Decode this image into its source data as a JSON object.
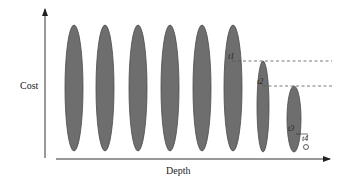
{
  "diagram": {
    "y_axis_label": "Cost",
    "x_axis_label": "Depth",
    "colors": {
      "ellipse_fill": "#6e6e6e",
      "ellipse_stroke": "#4a4a4a",
      "axis": "#333333",
      "dashed": "#555555"
    },
    "ellipses": [
      {
        "cx": 74,
        "top": 25,
        "bottom": 151,
        "rx": 9
      },
      {
        "cx": 105,
        "top": 25,
        "bottom": 151,
        "rx": 9
      },
      {
        "cx": 138,
        "top": 25,
        "bottom": 151,
        "rx": 9
      },
      {
        "cx": 170,
        "top": 25,
        "bottom": 151,
        "rx": 9
      },
      {
        "cx": 202,
        "top": 25,
        "bottom": 151,
        "rx": 9
      },
      {
        "cx": 233,
        "top": 25,
        "bottom": 151,
        "rx": 9
      },
      {
        "cx": 263,
        "top": 61,
        "bottom": 152,
        "rx": 6
      },
      {
        "cx": 294,
        "top": 86,
        "bottom": 152,
        "rx": 7
      }
    ],
    "thresholds": [
      {
        "label": "t1",
        "y": 61,
        "x_start": 232,
        "x_end": 332,
        "label_x": 228,
        "label_y": 59
      },
      {
        "label": "t2",
        "y": 86,
        "x_start": 263,
        "x_end": 332,
        "label_x": 257,
        "label_y": 84
      },
      {
        "label": "t3",
        "label_x": 288,
        "label_y": 131
      },
      {
        "label": "t4",
        "label_x": 302,
        "label_y": 141
      }
    ],
    "t4_marker": {
      "cx": 306,
      "cy": 147,
      "r": 2.5
    }
  }
}
